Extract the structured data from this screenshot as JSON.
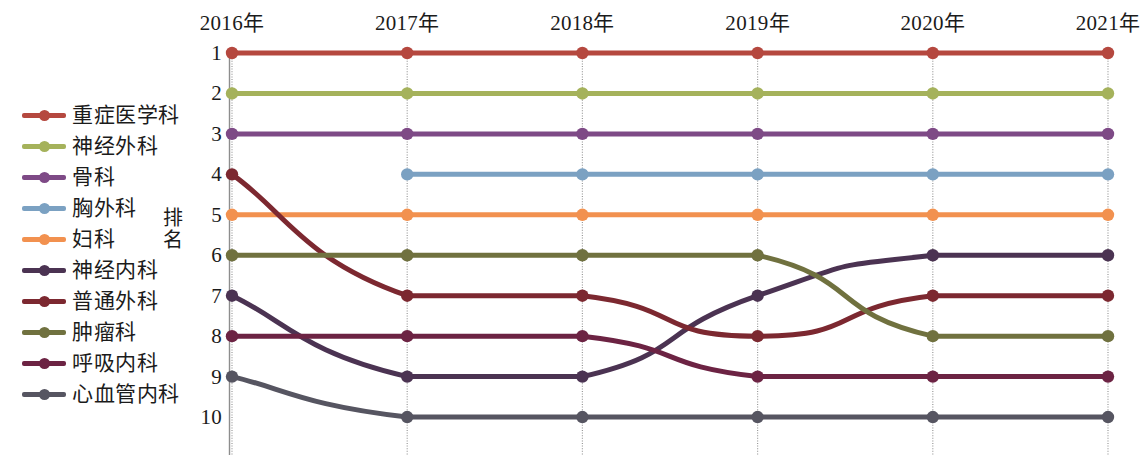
{
  "chart_data": {
    "type": "line",
    "title": "",
    "xlabel": "",
    "ylabel": "排名",
    "x": [
      "2016年",
      "2017年",
      "2018年",
      "2019年",
      "2020年",
      "2021年"
    ],
    "yticks": [
      "1",
      "2",
      "3",
      "4",
      "5",
      "6",
      "7",
      "8",
      "9",
      "10"
    ],
    "ylim": [
      1,
      10
    ],
    "y_inverted": true,
    "grid": "vertical-only",
    "legend_position": "left-outside",
    "series": [
      {
        "name": "重症医学科",
        "color": "#b5483f",
        "values": [
          1,
          1,
          1,
          1,
          1,
          1
        ]
      },
      {
        "name": "神经外科",
        "color": "#a5b25b",
        "values": [
          2,
          2,
          2,
          2,
          2,
          2
        ]
      },
      {
        "name": "骨科",
        "color": "#7e4a86",
        "values": [
          3,
          3,
          3,
          3,
          3,
          3
        ]
      },
      {
        "name": "胸外科",
        "color": "#7ba1c2",
        "values": [
          null,
          4,
          4,
          4,
          4,
          4
        ]
      },
      {
        "name": "妇科",
        "color": "#f2914f",
        "values": [
          5,
          5,
          5,
          5,
          5,
          5
        ]
      },
      {
        "name": "神经内科",
        "color": "#4b3352",
        "values": [
          7,
          9,
          9,
          7,
          6,
          6
        ]
      },
      {
        "name": "普通外科",
        "color": "#7c2830",
        "values": [
          4,
          7,
          7,
          8,
          7,
          7
        ]
      },
      {
        "name": "肿瘤科",
        "color": "#70713f",
        "values": [
          6,
          6,
          6,
          6,
          8,
          8
        ]
      },
      {
        "name": "呼吸内科",
        "color": "#6c2343",
        "values": [
          8,
          8,
          8,
          9,
          9,
          9
        ]
      },
      {
        "name": "心血管内科",
        "color": "#565561",
        "values": [
          9,
          10,
          10,
          10,
          10,
          10
        ]
      }
    ]
  }
}
